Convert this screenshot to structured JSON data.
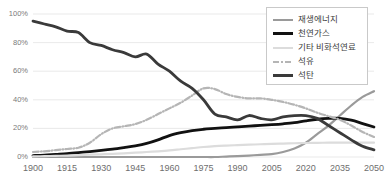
{
  "chart_data": {
    "type": "line",
    "title": "",
    "xlabel": "",
    "ylabel": "",
    "xlim": [
      1900,
      2050
    ],
    "ylim": [
      0,
      100
    ],
    "grid": true,
    "legend_position": "top-right",
    "x_ticks": [
      "1900",
      "1915",
      "1930",
      "1945",
      "1960",
      "1975",
      "1990",
      "2005",
      "2020",
      "2035",
      "2050"
    ],
    "y_ticks": [
      "0%",
      "20%",
      "40%",
      "60%",
      "80%",
      "100%"
    ],
    "x": [
      1900,
      1905,
      1910,
      1915,
      1920,
      1925,
      1930,
      1935,
      1940,
      1945,
      1950,
      1955,
      1960,
      1965,
      1970,
      1975,
      1980,
      1985,
      1990,
      1995,
      2000,
      2005,
      2010,
      2015,
      2020,
      2025,
      2030,
      2035,
      2040,
      2045,
      2050
    ],
    "series": [
      {
        "name": "재생에너지",
        "color": "#9a9a9a",
        "style": "solid",
        "width": 2.2,
        "values": [
          0,
          0,
          0,
          0,
          0,
          0,
          0,
          0,
          0,
          0,
          0,
          0,
          0,
          0,
          0,
          0,
          0,
          0.3,
          0.6,
          1,
          1.5,
          2,
          3.5,
          6,
          10,
          16,
          22,
          29,
          36,
          42,
          46
        ]
      },
      {
        "name": "천연가스",
        "color": "#111111",
        "style": "solid",
        "width": 2.8,
        "values": [
          1,
          1.3,
          1.8,
          2.3,
          3,
          3.8,
          4.6,
          5.5,
          6.6,
          7.8,
          9.5,
          12,
          15,
          17,
          18.5,
          19.4,
          20,
          20.6,
          21.1,
          21.6,
          22.1,
          22.6,
          23.2,
          24,
          25.3,
          26.4,
          27,
          27,
          25.8,
          23.4,
          21
        ]
      },
      {
        "name": "기타 비화석연료",
        "color": "#dcdcdc",
        "style": "solid",
        "width": 2.2,
        "values": [
          0.4,
          0.6,
          0.8,
          1,
          1.3,
          1.6,
          1.9,
          2.2,
          2.6,
          3,
          3.5,
          4,
          4.6,
          5.4,
          6.2,
          7,
          7.6,
          8,
          8.3,
          8.6,
          8.9,
          9.2,
          9.4,
          9.6,
          9.8,
          9.9,
          10,
          10,
          10,
          10,
          10
        ]
      },
      {
        "name": "석유",
        "color": "#b5b5b5",
        "style": "dash-dot",
        "width": 2.2,
        "values": [
          3.5,
          4,
          4.8,
          5.6,
          6.5,
          10,
          16,
          20,
          21.5,
          23,
          26,
          30,
          34,
          38,
          43,
          48,
          47.5,
          44,
          42,
          41,
          41,
          40,
          38.5,
          36.5,
          34,
          31,
          28.5,
          26,
          22,
          17.5,
          14
        ]
      },
      {
        "name": "석탄",
        "color": "#3a3a3a",
        "style": "solid",
        "width": 2.8,
        "values": [
          95,
          93,
          91,
          88,
          87,
          80,
          78,
          75,
          73,
          70,
          72,
          65,
          60,
          53,
          48,
          40,
          30,
          28,
          26,
          29,
          27,
          26,
          28,
          29,
          29,
          27,
          22,
          17,
          12,
          7.5,
          5
        ]
      }
    ]
  }
}
